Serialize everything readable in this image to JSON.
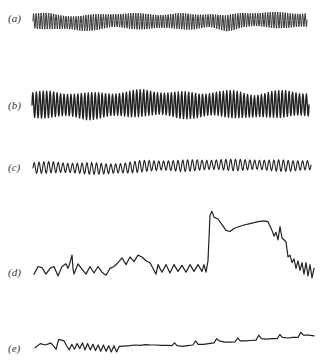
{
  "chart_data": {
    "type": "line",
    "title": "",
    "xlabel": "",
    "ylabel": "",
    "grid": false,
    "legend": "none",
    "panels": [
      {
        "label": "(a)",
        "description": "dense high-frequency regular oscillation with slight baseline wander",
        "cycles": 110,
        "amplitude": 0.9,
        "baseline": [
          0.0,
          0.0,
          -0.3,
          -0.5,
          -0.2,
          0.1,
          0.0,
          -0.1,
          -0.1,
          0.0,
          -0.2,
          0.1,
          -0.5,
          0.2,
          0.3,
          0.2,
          0.1,
          0.2
        ],
        "stroke_width": 0.9
      },
      {
        "label": "(b)",
        "description": "dense regular high-amplitude oscillation, slowly modulated envelope",
        "cycles": 80,
        "amplitude": 1.0,
        "baseline": [
          0.0,
          0.1,
          0.0,
          -0.2,
          0.0,
          0.1,
          0.3,
          0.2,
          0.0,
          -0.1,
          0.2,
          0.1,
          -0.2,
          0.1,
          0.2,
          0.0
        ],
        "stroke_width": 1.4
      },
      {
        "label": "(c)",
        "description": "regular oscillation with lower frequency and rising baseline",
        "cycles": 58,
        "amplitude": 0.75,
        "baseline": [
          0.0,
          0.2,
          0.0,
          -0.1,
          -0.2,
          0.0,
          0.5,
          0.6,
          0.5,
          0.7,
          0.8,
          0.7,
          0.8,
          0.6,
          0.5,
          0.7
        ],
        "stroke_width": 1.1
      },
      {
        "label": "(d)",
        "description": "irregular oscillation followed by abrupt large rise, plateau and decay back to oscillation",
        "points": [
          [
            0,
            0.05
          ],
          [
            2,
            0.25
          ],
          [
            4,
            0.22
          ],
          [
            6,
            0.05
          ],
          [
            8,
            0.2
          ],
          [
            10,
            0.25
          ],
          [
            12,
            0.0
          ],
          [
            14,
            0.25
          ],
          [
            16,
            0.32
          ],
          [
            17,
            0.2
          ],
          [
            18,
            0.35
          ],
          [
            19,
            0.55
          ],
          [
            19.5,
            0.2
          ],
          [
            20,
            0.05
          ],
          [
            22,
            0.32
          ],
          [
            24,
            0.18
          ],
          [
            26,
            0.05
          ],
          [
            28,
            0.25
          ],
          [
            30,
            0.08
          ],
          [
            32,
            0.25
          ],
          [
            34,
            0.1
          ],
          [
            36,
            0.02
          ],
          [
            38,
            0.2
          ],
          [
            40,
            0.25
          ],
          [
            42,
            0.35
          ],
          [
            44,
            0.48
          ],
          [
            46,
            0.3
          ],
          [
            48,
            0.5
          ],
          [
            50,
            0.38
          ],
          [
            52,
            0.55
          ],
          [
            54,
            0.5
          ],
          [
            56,
            0.4
          ],
          [
            58,
            0.35
          ],
          [
            60,
            0.15
          ],
          [
            61,
            0.05
          ],
          [
            62,
            0.3
          ],
          [
            64,
            0.1
          ],
          [
            66,
            0.3
          ],
          [
            68,
            0.08
          ],
          [
            70,
            0.3
          ],
          [
            72,
            0.12
          ],
          [
            74,
            0.28
          ],
          [
            76,
            0.1
          ],
          [
            78,
            0.3
          ],
          [
            80,
            0.12
          ],
          [
            82,
            0.3
          ],
          [
            84,
            0.12
          ],
          [
            85,
            0.3
          ],
          [
            86,
            0.1
          ],
          [
            87,
            0.4
          ],
          [
            88,
            1.6
          ],
          [
            89,
            1.7
          ],
          [
            90,
            1.55
          ],
          [
            92,
            1.5
          ],
          [
            94,
            1.35
          ],
          [
            96,
            1.2
          ],
          [
            98,
            1.17
          ],
          [
            100,
            1.25
          ],
          [
            104,
            1.33
          ],
          [
            108,
            1.38
          ],
          [
            112,
            1.43
          ],
          [
            115,
            1.45
          ],
          [
            117,
            1.43
          ],
          [
            119,
            1.2
          ],
          [
            120,
            1.05
          ],
          [
            121,
            1.15
          ],
          [
            122,
            0.95
          ],
          [
            123,
            1.3
          ],
          [
            124,
            1.0
          ],
          [
            126,
            0.9
          ],
          [
            127,
            0.5
          ],
          [
            128,
            0.55
          ],
          [
            129,
            0.35
          ],
          [
            130,
            0.45
          ],
          [
            131,
            0.2
          ],
          [
            132,
            0.4
          ],
          [
            133,
            0.15
          ],
          [
            134,
            0.35
          ],
          [
            135,
            0.05
          ],
          [
            136,
            0.35
          ],
          [
            137,
            0.0
          ],
          [
            138,
            0.3
          ],
          [
            139,
            -0.05
          ],
          [
            140,
            0.2
          ]
        ],
        "stroke_width": 1.2
      },
      {
        "label": "(e)",
        "description": "irregular oscillation damping into flat baseline with periodic small spikes, slowly rising",
        "points": [
          [
            0,
            0.3
          ],
          [
            2,
            0.6
          ],
          [
            4,
            0.5
          ],
          [
            6,
            0.65
          ],
          [
            8,
            0.2
          ],
          [
            9,
            0.9
          ],
          [
            11,
            0.8
          ],
          [
            12,
            0.45
          ],
          [
            13,
            0.15
          ],
          [
            14,
            0.55
          ],
          [
            15,
            0.2
          ],
          [
            16,
            0.6
          ],
          [
            17,
            0.25
          ],
          [
            18,
            0.65
          ],
          [
            19,
            0.15
          ],
          [
            20,
            0.6
          ],
          [
            21,
            0.15
          ],
          [
            22,
            0.55
          ],
          [
            23,
            0.1
          ],
          [
            24,
            0.5
          ],
          [
            25,
            0.05
          ],
          [
            26,
            0.5
          ],
          [
            27,
            0.05
          ],
          [
            28,
            0.45
          ],
          [
            29,
            0.0
          ],
          [
            30,
            0.45
          ],
          [
            31,
            0.0
          ],
          [
            32,
            0.4
          ],
          [
            34,
            0.42
          ],
          [
            36,
            0.45
          ],
          [
            38,
            0.5
          ],
          [
            40,
            0.48
          ],
          [
            42,
            0.52
          ],
          [
            44,
            0.5
          ],
          [
            46,
            0.5
          ],
          [
            48,
            0.48
          ],
          [
            50,
            0.47
          ],
          [
            52,
            0.46
          ],
          [
            53,
            0.65
          ],
          [
            54,
            0.45
          ],
          [
            56,
            0.4
          ],
          [
            58,
            0.45
          ],
          [
            60,
            0.5
          ],
          [
            61,
            0.8
          ],
          [
            62,
            0.55
          ],
          [
            64,
            0.55
          ],
          [
            66,
            0.6
          ],
          [
            68,
            0.65
          ],
          [
            69,
            0.95
          ],
          [
            70,
            0.8
          ],
          [
            72,
            0.7
          ],
          [
            74,
            0.7
          ],
          [
            76,
            0.72
          ],
          [
            77,
            1.0
          ],
          [
            78,
            0.8
          ],
          [
            80,
            0.8
          ],
          [
            82,
            0.82
          ],
          [
            84,
            0.85
          ],
          [
            85,
            1.2
          ],
          [
            86,
            0.95
          ],
          [
            88,
            0.92
          ],
          [
            90,
            0.95
          ],
          [
            92,
            0.95
          ],
          [
            93,
            1.25
          ],
          [
            94,
            1.05
          ],
          [
            96,
            1.0
          ],
          [
            98,
            1.05
          ],
          [
            100,
            1.05
          ],
          [
            101,
            1.4
          ],
          [
            102,
            1.2
          ],
          [
            104,
            1.2
          ],
          [
            106,
            1.15
          ]
        ],
        "stroke_width": 1.2
      }
    ]
  }
}
